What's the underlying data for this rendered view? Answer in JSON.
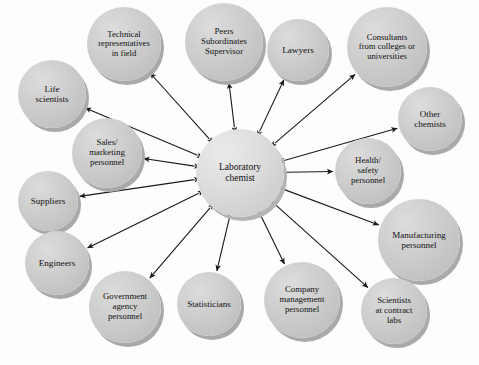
{
  "diagram": {
    "type": "hub-and-spoke network diagram",
    "edge_style": "double-headed arrow",
    "colors": {
      "background": "#fdfdfd",
      "node_fill": "#cfcfcf",
      "hub_fill": "#e0e0e0",
      "node_shadow": "#a9a9a9",
      "edge": "#1a1a1a",
      "text": "#111111"
    },
    "hub": {
      "id": "laboratory-chemist",
      "label": "Laboratory\nchemist",
      "lines": [
        "Laboratory",
        "chemist"
      ],
      "cx": 240,
      "cy": 173,
      "r": 44,
      "font_size": 9.5
    },
    "nodes": [
      {
        "id": "life-scientists",
        "lines": [
          "Life",
          "scientists"
        ],
        "cx": 52,
        "cy": 94,
        "r": 34,
        "font_size": 9
      },
      {
        "id": "technical-representatives-in-field",
        "lines": [
          "Technical",
          "representatives",
          "in field"
        ],
        "cx": 124,
        "cy": 44,
        "r": 37,
        "font_size": 8.6
      },
      {
        "id": "peers-subordinates-supervisor",
        "lines": [
          "Peers",
          "Subordinates",
          "Supervisor"
        ],
        "cx": 224,
        "cy": 42,
        "r": 39,
        "font_size": 8.8
      },
      {
        "id": "lawyers",
        "lines": [
          "Lawyers"
        ],
        "cx": 298,
        "cy": 50,
        "r": 31,
        "font_size": 9.2
      },
      {
        "id": "consultants-from-colleges-or-universities",
        "lines": [
          "Consultants",
          "from colleges or",
          "universities"
        ],
        "cx": 387,
        "cy": 47,
        "r": 40,
        "font_size": 8.6
      },
      {
        "id": "other-chemists",
        "lines": [
          "Other",
          "chemists"
        ],
        "cx": 430,
        "cy": 119,
        "r": 32,
        "font_size": 9
      },
      {
        "id": "sales-marketing-personnel",
        "lines": [
          "Sales/",
          "marketing",
          "personnel"
        ],
        "cx": 107,
        "cy": 153,
        "r": 35,
        "font_size": 8.8
      },
      {
        "id": "health-safety-personnel",
        "lines": [
          "Health/",
          "safety",
          "personnel"
        ],
        "cx": 368,
        "cy": 171,
        "r": 33,
        "font_size": 8.8
      },
      {
        "id": "suppliers",
        "lines": [
          "Suppliers"
        ],
        "cx": 48,
        "cy": 201,
        "r": 30,
        "font_size": 9.2
      },
      {
        "id": "manufacturing-personnel",
        "lines": [
          "Manufacturing",
          "personnel"
        ],
        "cx": 419,
        "cy": 240,
        "r": 41,
        "font_size": 9
      },
      {
        "id": "engineers",
        "lines": [
          "Engineers"
        ],
        "cx": 57,
        "cy": 263,
        "r": 32,
        "font_size": 9.2
      },
      {
        "id": "government-agency-personnel",
        "lines": [
          "Government",
          "agency",
          "personnel"
        ],
        "cx": 125,
        "cy": 307,
        "r": 36,
        "font_size": 8.8
      },
      {
        "id": "statisticians",
        "lines": [
          "Statisticians"
        ],
        "cx": 209,
        "cy": 304,
        "r": 32,
        "font_size": 9
      },
      {
        "id": "company-management-personnel",
        "lines": [
          "Company",
          "management",
          "personnel"
        ],
        "cx": 302,
        "cy": 300,
        "r": 38,
        "font_size": 8.8
      },
      {
        "id": "scientists-at-contract-labs",
        "lines": [
          "Scientists",
          "at contract",
          "labs"
        ],
        "cx": 394,
        "cy": 311,
        "r": 33,
        "font_size": 8.8
      }
    ],
    "edges": [
      {
        "from": "laboratory-chemist",
        "to": "life-scientists",
        "bidirectional": true
      },
      {
        "from": "laboratory-chemist",
        "to": "technical-representatives-in-field",
        "bidirectional": true
      },
      {
        "from": "laboratory-chemist",
        "to": "peers-subordinates-supervisor",
        "bidirectional": true
      },
      {
        "from": "laboratory-chemist",
        "to": "lawyers",
        "bidirectional": true
      },
      {
        "from": "laboratory-chemist",
        "to": "consultants-from-colleges-or-universities",
        "bidirectional": true
      },
      {
        "from": "laboratory-chemist",
        "to": "other-chemists",
        "bidirectional": true
      },
      {
        "from": "laboratory-chemist",
        "to": "sales-marketing-personnel",
        "bidirectional": true
      },
      {
        "from": "laboratory-chemist",
        "to": "health-safety-personnel",
        "bidirectional": true
      },
      {
        "from": "laboratory-chemist",
        "to": "suppliers",
        "bidirectional": true
      },
      {
        "from": "laboratory-chemist",
        "to": "manufacturing-personnel",
        "bidirectional": true
      },
      {
        "from": "laboratory-chemist",
        "to": "engineers",
        "bidirectional": true
      },
      {
        "from": "laboratory-chemist",
        "to": "government-agency-personnel",
        "bidirectional": true
      },
      {
        "from": "laboratory-chemist",
        "to": "statisticians",
        "bidirectional": true
      },
      {
        "from": "laboratory-chemist",
        "to": "company-management-personnel",
        "bidirectional": true
      },
      {
        "from": "laboratory-chemist",
        "to": "scientists-at-contract-labs",
        "bidirectional": true
      }
    ]
  }
}
